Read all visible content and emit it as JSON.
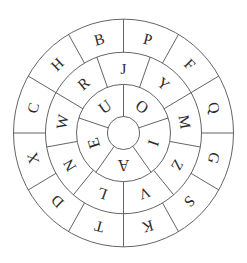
{
  "diagram": {
    "type": "concentric cipher wheel",
    "center": {
      "x": 123.5,
      "y": 133
    },
    "scale_y": 1.035,
    "colors": {
      "line": "#555555",
      "text": "#2a2a2a",
      "background": "#ffffff"
    },
    "rings": {
      "outer": {
        "inner_radius": 78,
        "outer_radius": 110,
        "divider_offset_deg": 0,
        "letters": [
          "P",
          "F",
          "Q",
          "G",
          "S",
          "K",
          "T",
          "D",
          "X",
          "C",
          "H",
          "B"
        ],
        "first_letter_angle_deg": 15
      },
      "middle": {
        "inner_radius": 47,
        "outer_radius": 78,
        "divider_offset_deg": 20,
        "letters": [
          "J",
          "Y",
          "M",
          "Z",
          "V",
          "L",
          "N",
          "W",
          "R"
        ],
        "first_letter_angle_deg": 0
      },
      "inner": {
        "inner_radius": 16,
        "outer_radius": 47,
        "divider_offset_deg": 0,
        "letters": [
          "O",
          "I",
          "A",
          "E",
          "U"
        ],
        "first_letter_angle_deg": 36
      }
    },
    "hub_radius": 16
  }
}
